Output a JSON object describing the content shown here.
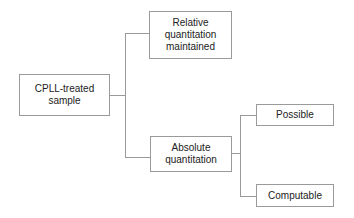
{
  "diagram": {
    "type": "tree",
    "root": {
      "label": "CPLL-treated sample"
    },
    "level1": [
      {
        "label": "Relative quantitation maintained"
      },
      {
        "label": "Absolute quantitation"
      }
    ],
    "level2": [
      {
        "parent": "Absolute quantitation",
        "label": "Possible"
      },
      {
        "parent": "Absolute quantitation",
        "label": "Computable"
      }
    ],
    "colors": {
      "line": "#9a9a9a",
      "border": "#9a9a9a",
      "text": "#222222",
      "background": "#ffffff"
    }
  },
  "nodes": {
    "root": "CPLL-treated sample",
    "relative": "Relative quantitation maintained",
    "absolute": "Absolute quantitation",
    "possible": "Possible",
    "computable": "Computable"
  }
}
